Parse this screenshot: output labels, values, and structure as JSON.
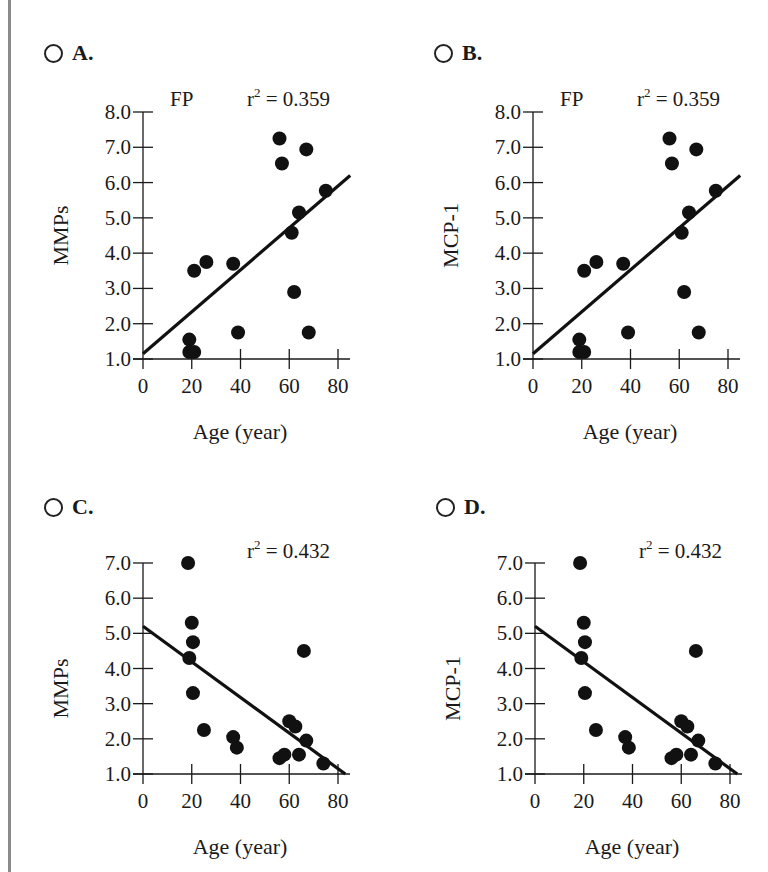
{
  "options": [
    {
      "id": "A",
      "label": "A.",
      "ylabel": "MMPs",
      "subtitle": "FP",
      "r2_label": "r",
      "r2_value": " = 0.359"
    },
    {
      "id": "B",
      "label": "B.",
      "ylabel": "MCP-1",
      "subtitle": "FP",
      "r2_label": "r",
      "r2_value": " = 0.359"
    },
    {
      "id": "C",
      "label": "C.",
      "ylabel": "MMPs",
      "subtitle": "",
      "r2_label": "r",
      "r2_value": " = 0.432"
    },
    {
      "id": "D",
      "label": "D.",
      "ylabel": "MCP-1",
      "subtitle": "",
      "r2_label": "r",
      "r2_value": " = 0.432"
    }
  ],
  "chart_data": [
    {
      "type": "scatter",
      "panel": "A",
      "title": "FP",
      "annotation": "r^2 = 0.359",
      "xlabel": "Age (year)",
      "ylabel": "MMPs",
      "xlim": [
        0,
        80
      ],
      "ylim": [
        1.0,
        8.0
      ],
      "xticks": [
        "0",
        "20",
        "40",
        "60",
        "80"
      ],
      "yticks": [
        "1.0",
        "2.0",
        "3.0",
        "4.0",
        "5.0",
        "6.0",
        "7.0",
        "8.0"
      ],
      "points": [
        [
          56,
          7.25
        ],
        [
          67,
          6.94
        ],
        [
          57,
          6.54
        ],
        [
          75,
          5.77
        ],
        [
          64,
          5.15
        ],
        [
          61,
          4.58
        ],
        [
          21,
          3.5
        ],
        [
          26,
          3.75
        ],
        [
          37,
          3.7
        ],
        [
          62,
          2.9
        ],
        [
          39,
          1.75
        ],
        [
          68,
          1.75
        ],
        [
          19,
          1.55
        ],
        [
          19,
          1.2
        ],
        [
          21,
          1.2
        ]
      ],
      "trendline": {
        "x": [
          0,
          85
        ],
        "y": [
          1.15,
          6.2
        ]
      },
      "grid": false
    },
    {
      "type": "scatter",
      "panel": "B",
      "title": "FP",
      "annotation": "r^2 = 0.359",
      "xlabel": "Age (year)",
      "ylabel": "MCP-1",
      "xlim": [
        0,
        80
      ],
      "ylim": [
        1.0,
        8.0
      ],
      "xticks": [
        "0",
        "20",
        "40",
        "60",
        "80"
      ],
      "yticks": [
        "1.0",
        "2.0",
        "3.0",
        "4.0",
        "5.0",
        "6.0",
        "7.0",
        "8.0"
      ],
      "points": [
        [
          56,
          7.25
        ],
        [
          67,
          6.94
        ],
        [
          57,
          6.54
        ],
        [
          75,
          5.77
        ],
        [
          64,
          5.15
        ],
        [
          61,
          4.58
        ],
        [
          21,
          3.5
        ],
        [
          26,
          3.75
        ],
        [
          37,
          3.7
        ],
        [
          62,
          2.9
        ],
        [
          39,
          1.75
        ],
        [
          68,
          1.75
        ],
        [
          19,
          1.55
        ],
        [
          19,
          1.2
        ],
        [
          21,
          1.2
        ]
      ],
      "trendline": {
        "x": [
          0,
          85
        ],
        "y": [
          1.15,
          6.2
        ]
      },
      "grid": false
    },
    {
      "type": "scatter",
      "panel": "C",
      "title": "",
      "annotation": "r^2 = 0.432",
      "xlabel": "Age (year)",
      "ylabel": "MMPs",
      "xlim": [
        0,
        80
      ],
      "ylim": [
        1.0,
        7.0
      ],
      "xticks": [
        "0",
        "20",
        "40",
        "60",
        "80"
      ],
      "yticks": [
        "1.0",
        "2.0",
        "3.0",
        "4.0",
        "5.0",
        "6.0",
        "7.0"
      ],
      "points": [
        [
          18.5,
          7.0
        ],
        [
          20,
          5.3
        ],
        [
          20.5,
          4.75
        ],
        [
          19,
          4.3
        ],
        [
          66,
          4.5
        ],
        [
          20.5,
          3.3
        ],
        [
          25,
          2.25
        ],
        [
          37,
          2.05
        ],
        [
          38.5,
          1.75
        ],
        [
          60,
          2.5
        ],
        [
          62.5,
          2.35
        ],
        [
          67,
          1.95
        ],
        [
          56,
          1.45
        ],
        [
          58,
          1.55
        ],
        [
          64,
          1.55
        ],
        [
          74,
          1.3
        ]
      ],
      "trendline": {
        "x": [
          0,
          83
        ],
        "y": [
          5.2,
          1.0
        ]
      },
      "grid": false
    },
    {
      "type": "scatter",
      "panel": "D",
      "title": "",
      "annotation": "r^2 = 0.432",
      "xlabel": "Age (year)",
      "ylabel": "MCP-1",
      "xlim": [
        0,
        80
      ],
      "ylim": [
        1.0,
        7.0
      ],
      "xticks": [
        "0",
        "20",
        "40",
        "60",
        "80"
      ],
      "yticks": [
        "1.0",
        "2.0",
        "3.0",
        "4.0",
        "5.0",
        "6.0",
        "7.0"
      ],
      "points": [
        [
          18.5,
          7.0
        ],
        [
          20,
          5.3
        ],
        [
          20.5,
          4.75
        ],
        [
          19,
          4.3
        ],
        [
          66,
          4.5
        ],
        [
          20.5,
          3.3
        ],
        [
          25,
          2.25
        ],
        [
          37,
          2.05
        ],
        [
          38.5,
          1.75
        ],
        [
          60,
          2.5
        ],
        [
          62.5,
          2.35
        ],
        [
          67,
          1.95
        ],
        [
          56,
          1.45
        ],
        [
          58,
          1.55
        ],
        [
          64,
          1.55
        ],
        [
          74,
          1.3
        ]
      ],
      "trendline": {
        "x": [
          0,
          83
        ],
        "y": [
          5.2,
          1.0
        ]
      },
      "grid": false
    }
  ]
}
